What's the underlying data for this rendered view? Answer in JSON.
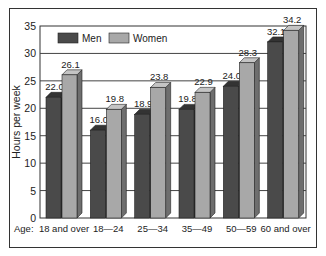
{
  "chart_data": {
    "type": "bar",
    "title": "",
    "xlabel": "Age:",
    "ylabel": "Hours per week",
    "ylim": [
      0,
      35
    ],
    "yticks": [
      0,
      5,
      10,
      15,
      20,
      25,
      30,
      35
    ],
    "grid": true,
    "legend_position": "top-left inside",
    "categories": [
      "18 and over",
      "18—24",
      "25—34",
      "35—49",
      "50—59",
      "60 and over"
    ],
    "series": [
      {
        "name": "Men",
        "color": "#4a4a4a",
        "values": [
          22.0,
          16.0,
          18.9,
          19.8,
          24.0,
          32.1
        ]
      },
      {
        "name": "Women",
        "color": "#a8a8a8",
        "values": [
          26.1,
          19.8,
          23.8,
          22.9,
          28.3,
          34.2
        ]
      }
    ],
    "value_labels": {
      "men": [
        "22.0",
        "16.0",
        "18.9",
        "19.8",
        "24.0",
        "32.1"
      ],
      "women": [
        "26.1",
        "19.8",
        "23.8",
        "22.9",
        "28.3",
        "34.2"
      ]
    }
  }
}
